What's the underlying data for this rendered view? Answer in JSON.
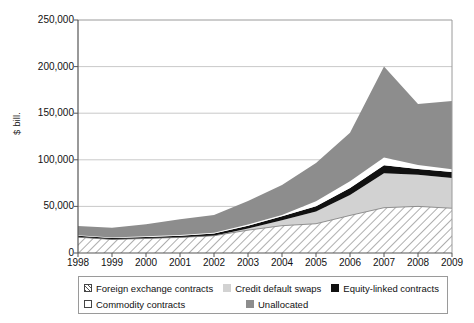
{
  "chart_data": {
    "type": "area",
    "title": "",
    "subtitle": "",
    "xlabel": "",
    "ylabel": "$ bill.",
    "stacked": true,
    "grid": true,
    "legend_position": "bottom",
    "categories": [
      "1998",
      "1999",
      "2000",
      "2001",
      "2002",
      "2003",
      "2004",
      "2005",
      "2006",
      "2007",
      "2008",
      "2009"
    ],
    "x": [
      1998,
      1999,
      2000,
      2001,
      2002,
      2003,
      2004,
      2005,
      2006,
      2007,
      2008,
      2009
    ],
    "xlim": [
      1998,
      2009
    ],
    "ylim": [
      0,
      250000
    ],
    "yticks": [
      0,
      50000,
      100000,
      150000,
      200000,
      250000
    ],
    "ytick_labels": [
      "0",
      "50,000",
      "100,000",
      "150,000",
      "200,000",
      "250,000"
    ],
    "series": [
      {
        "name": "Foreign exchange contracts",
        "color": "#ffffff",
        "pattern": "diagonal-hatch",
        "values": [
          17000,
          14500,
          15600,
          16700,
          18500,
          24500,
          29300,
          31400,
          40300,
          48600,
          50000,
          48000
        ]
      },
      {
        "name": "Credit default swaps",
        "color": "#d2d2d2",
        "pattern": "solid",
        "values": [
          0,
          0,
          0,
          0,
          0,
          1800,
          5800,
          13000,
          22000,
          37000,
          34000,
          32500
        ]
      },
      {
        "name": "Equity-linked contracts",
        "color": "#111111",
        "pattern": "solid",
        "values": [
          1500,
          1500,
          1700,
          1900,
          2300,
          3000,
          4400,
          5800,
          7500,
          8500,
          6000,
          6500
        ]
      },
      {
        "name": "Commodity contracts",
        "color": "#ffffff",
        "pattern": "solid",
        "values": [
          450,
          500,
          600,
          700,
          900,
          1400,
          1400,
          5400,
          7100,
          8400,
          4400,
          2900
        ]
      },
      {
        "name": "Unallocated",
        "color": "#8d8d8d",
        "pattern": "solid",
        "values": [
          10000,
          10500,
          13000,
          17000,
          19000,
          25000,
          32000,
          41000,
          52000,
          97500,
          65600,
          73100
        ]
      }
    ],
    "cumulative_tops": {
      "foreign_exchange": [
        17000,
        14500,
        15600,
        16700,
        18500,
        24500,
        29300,
        31400,
        40300,
        48600,
        50000,
        48000
      ],
      "credit_default_swaps": [
        17000,
        14500,
        15600,
        16700,
        18500,
        26300,
        35100,
        44400,
        62300,
        85600,
        84000,
        80500
      ],
      "equity_linked": [
        18500,
        16000,
        17300,
        18600,
        20800,
        29300,
        39500,
        50200,
        69800,
        94100,
        90000,
        87000
      ],
      "commodity": [
        18950,
        16500,
        17900,
        19300,
        21700,
        30700,
        40900,
        55600,
        76900,
        102500,
        94400,
        89900
      ],
      "total": [
        28950,
        27000,
        30900,
        36300,
        40700,
        55700,
        72900,
        96600,
        128900,
        200000,
        160000,
        163000
      ]
    },
    "annotations": []
  },
  "legend": {
    "items": [
      {
        "label": "Foreign exchange contracts",
        "swatch": "hatched-swatch"
      },
      {
        "label": "Credit default swaps",
        "swatch": "light-gray-swatch"
      },
      {
        "label": "Equity-linked contracts",
        "swatch": "black-swatch"
      },
      {
        "label": "Commodity contracts",
        "swatch": "white-swatch"
      },
      {
        "label": "Unallocated",
        "swatch": "dark-gray-swatch"
      }
    ]
  }
}
